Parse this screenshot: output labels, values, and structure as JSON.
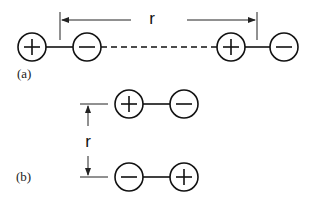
{
  "figure": {
    "part_a": {
      "label": "(a)",
      "distance_label": "r",
      "dipole_left": {
        "left_charge": "+",
        "right_charge": "−"
      },
      "dipole_right": {
        "left_charge": "+",
        "right_charge": "−"
      },
      "connector": "dashed"
    },
    "part_b": {
      "label": "(b)",
      "distance_label": "r",
      "dipole_top": {
        "left_charge": "+",
        "right_charge": "−"
      },
      "dipole_bottom": {
        "left_charge": "−",
        "right_charge": "+"
      }
    }
  }
}
